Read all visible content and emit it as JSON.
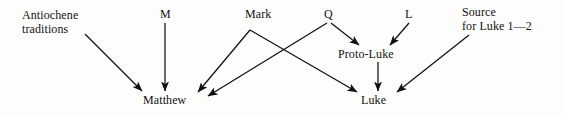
{
  "figure": {
    "background_color": "#fdfdfc",
    "ink_color": "#111111"
  },
  "nodes": [
    {
      "id": "antiochene",
      "label": "Antiochene\ntraditions",
      "x": 22,
      "y": 8,
      "lines": 2
    },
    {
      "id": "m",
      "label": "M",
      "x": 160,
      "y": 8,
      "lines": 1
    },
    {
      "id": "mark",
      "label": "Mark",
      "x": 245,
      "y": 8,
      "lines": 1
    },
    {
      "id": "q",
      "label": "Q",
      "x": 324,
      "y": 8,
      "lines": 1
    },
    {
      "id": "l",
      "label": "L",
      "x": 405,
      "y": 8,
      "lines": 1
    },
    {
      "id": "source-luke-1-2",
      "label": "Source\nfor Luke 1—2",
      "x": 462,
      "y": 5,
      "lines": 2
    },
    {
      "id": "proto-luke",
      "label": "Proto-Luke",
      "x": 338,
      "y": 48,
      "lines": 1
    },
    {
      "id": "matthew",
      "label": "Matthew",
      "x": 143,
      "y": 94,
      "lines": 1
    },
    {
      "id": "luke",
      "label": "Luke",
      "x": 361,
      "y": 94,
      "lines": 1
    }
  ],
  "edges": [
    {
      "id": "antiochene-to-matthew",
      "from": "antiochene",
      "to": "matthew",
      "points": "85,34 142,91",
      "arrow": true
    },
    {
      "id": "m-to-matthew",
      "from": "m",
      "to": "matthew",
      "points": "165,23 165,91",
      "arrow": true
    },
    {
      "id": "mark-to-matthew",
      "from": "mark",
      "to": "matthew",
      "points": "250,30 198,92",
      "arrow": true
    },
    {
      "id": "mark-to-luke",
      "from": "mark",
      "to": "luke",
      "points": "250,30 357,92",
      "arrow": true
    },
    {
      "id": "q-to-matthew",
      "from": "q",
      "to": "matthew",
      "points": "327,23 208,96",
      "arrow": true
    },
    {
      "id": "q-to-proto-luke",
      "from": "q",
      "to": "proto-luke",
      "points": "331,23 359,45",
      "arrow": true
    },
    {
      "id": "l-to-proto-luke",
      "from": "l",
      "to": "proto-luke",
      "points": "409,23 390,45",
      "arrow": true
    },
    {
      "id": "proto-luke-to-luke",
      "from": "proto-luke",
      "to": "luke",
      "points": "378,62 378,91",
      "arrow": true
    },
    {
      "id": "source-to-luke",
      "from": "source-luke-1-2",
      "to": "luke",
      "points": "469,35 397,92",
      "arrow": true
    }
  ],
  "chart_data": {
    "type": "diagram",
    "node_labels": [
      "Antiochene traditions",
      "M",
      "Mark",
      "Q",
      "L",
      "Source for Luke 1—2",
      "Proto-Luke",
      "Matthew",
      "Luke"
    ],
    "relations": [
      [
        "Antiochene traditions",
        "Matthew"
      ],
      [
        "M",
        "Matthew"
      ],
      [
        "Mark",
        "Matthew"
      ],
      [
        "Mark",
        "Luke"
      ],
      [
        "Q",
        "Matthew"
      ],
      [
        "Q",
        "Proto-Luke"
      ],
      [
        "L",
        "Proto-Luke"
      ],
      [
        "Proto-Luke",
        "Luke"
      ],
      [
        "Source for Luke 1—2",
        "Luke"
      ]
    ]
  }
}
